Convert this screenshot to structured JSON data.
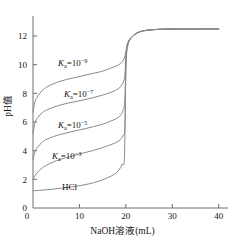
{
  "chart_data": {
    "type": "line",
    "title": "",
    "xlabel": "NaOH溶液(mL)",
    "ylabel": "pH值",
    "xlim": [
      0,
      42
    ],
    "ylim": [
      0,
      13.4
    ],
    "xticks": [
      "0",
      "10",
      "20",
      "30",
      "40"
    ],
    "xtick_values": [
      0,
      10,
      20,
      30,
      40
    ],
    "yticks": [
      "0",
      "2",
      "4",
      "6",
      "8",
      "10",
      "12"
    ],
    "ytick_values": [
      0,
      2,
      4,
      6,
      8,
      10,
      12
    ],
    "grid": false,
    "legend_position": "inline-annotations",
    "equivalence_point_x": 20,
    "plateau_ph": 12.5,
    "series": [
      {
        "name": "Ka=10^-9",
        "label_base": "K",
        "label_sub": "a",
        "label_eq": "=10",
        "label_sup": "−9",
        "start_ph": 6.7,
        "x": [
          0,
          0.4,
          1,
          2,
          3,
          5,
          7,
          9,
          11,
          13,
          15,
          17,
          18.5,
          19.4,
          19.8,
          20,
          20.4,
          21.5,
          23,
          25,
          28,
          32,
          36,
          40
        ],
        "y": [
          6.7,
          7.4,
          7.8,
          8.2,
          8.45,
          8.75,
          8.95,
          9.1,
          9.25,
          9.4,
          9.55,
          9.8,
          10.0,
          10.3,
          10.6,
          10.9,
          11.5,
          12.0,
          12.3,
          12.42,
          12.48,
          12.5,
          12.5,
          12.5
        ]
      },
      {
        "name": "Ka=10^-7",
        "label_base": "K",
        "label_sub": "a",
        "label_eq": "=10",
        "label_sup": "−7",
        "start_ph": 5.2,
        "x": [
          0,
          0.4,
          1,
          2,
          3,
          5,
          7,
          9,
          11,
          13,
          15,
          17,
          18.5,
          19.4,
          19.8,
          20,
          20.4,
          21.5,
          23,
          25,
          28,
          32,
          36,
          40
        ],
        "y": [
          5.2,
          5.9,
          6.3,
          6.65,
          6.85,
          7.1,
          7.28,
          7.42,
          7.55,
          7.7,
          7.88,
          8.1,
          8.35,
          8.75,
          9.3,
          10.6,
          11.5,
          12.0,
          12.3,
          12.42,
          12.48,
          12.5,
          12.5,
          12.5
        ]
      },
      {
        "name": "Ka=10^-5",
        "label_base": "K",
        "label_sub": "a",
        "label_eq": "=10",
        "label_sup": "−5",
        "start_ph": 3.4,
        "x": [
          0,
          0.4,
          1,
          2,
          3,
          5,
          7,
          9,
          11,
          13,
          15,
          17,
          18.5,
          19.4,
          19.8,
          20,
          20.4,
          21.5,
          23,
          25,
          28,
          32,
          36,
          40
        ],
        "y": [
          3.4,
          3.9,
          4.25,
          4.6,
          4.8,
          5.05,
          5.22,
          5.38,
          5.52,
          5.68,
          5.85,
          6.1,
          6.35,
          6.8,
          7.6,
          10.3,
          11.5,
          12.0,
          12.3,
          12.42,
          12.48,
          12.5,
          12.5,
          12.5
        ]
      },
      {
        "name": "Ka=10^-3",
        "label_base": "K",
        "label_sub": "a",
        "label_eq": "=10",
        "label_sup": "−3",
        "start_ph": 2.0,
        "x": [
          0,
          0.4,
          1,
          2,
          3,
          5,
          7,
          9,
          11,
          13,
          15,
          17,
          18.5,
          19.4,
          19.8,
          20,
          20.4,
          21.5,
          23,
          25,
          28,
          32,
          36,
          40
        ],
        "y": [
          2.0,
          2.25,
          2.5,
          2.8,
          3.0,
          3.3,
          3.5,
          3.68,
          3.85,
          4.02,
          4.22,
          4.45,
          4.68,
          5.05,
          5.7,
          9.9,
          11.4,
          12.0,
          12.3,
          12.42,
          12.48,
          12.5,
          12.5,
          12.5
        ]
      },
      {
        "name": "HCl",
        "label_base": "HCl",
        "label_sub": "",
        "label_eq": "",
        "label_sup": "",
        "start_ph": 1.2,
        "x": [
          0,
          2,
          4,
          6,
          8,
          10,
          12,
          14,
          16,
          17.5,
          18.5,
          19.2,
          19.7,
          20,
          20.4,
          21.5,
          23,
          25,
          28,
          32,
          36,
          40
        ],
        "y": [
          1.2,
          1.25,
          1.3,
          1.38,
          1.45,
          1.55,
          1.68,
          1.85,
          2.1,
          2.35,
          2.65,
          3.05,
          3.6,
          9.4,
          11.3,
          12.0,
          12.3,
          12.42,
          12.48,
          12.5,
          12.5,
          12.5
        ]
      }
    ],
    "annotations": [
      {
        "text": "Ka=10^-9",
        "x_px": 58,
        "y_px": 66
      },
      {
        "text": "Ka=10^-7",
        "x_px": 64,
        "y_px": 97
      },
      {
        "text": "Ka=10^-5",
        "x_px": 58,
        "y_px": 128
      },
      {
        "text": "Ka=10^-3",
        "x_px": 52,
        "y_px": 159
      },
      {
        "text": "HCl",
        "x_px": 62,
        "y_px": 190
      }
    ]
  },
  "axes": {
    "x_axis_name": "naoh-volume-axis",
    "y_axis_name": "ph-axis"
  }
}
